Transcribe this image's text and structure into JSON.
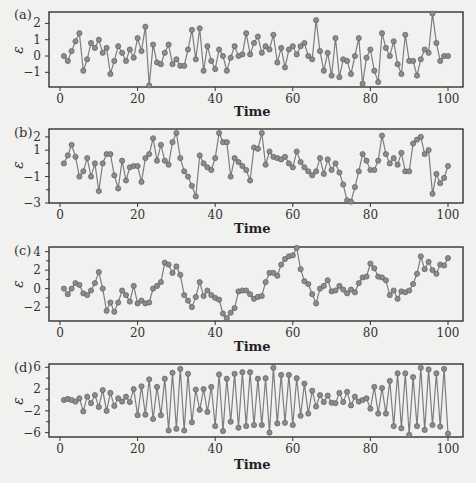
{
  "figure": {
    "background": "#f1f1ef",
    "line_color": "#7d7d7d",
    "marker_fill": "#8c8c8c",
    "marker_stroke": "#5e5e5e",
    "frame_color": "#333333"
  },
  "chart_data": [
    {
      "type": "line",
      "panel": "(a)",
      "title": "",
      "xlabel": "Time",
      "ylabel": "ε",
      "xlim": [
        -4,
        104
      ],
      "ylim": [
        -1.9,
        2.7
      ],
      "xticks": [
        0,
        20,
        40,
        60,
        80,
        100
      ],
      "yticks": [
        2,
        1,
        0,
        -1
      ],
      "grid": false,
      "x": [
        1,
        2,
        3,
        4,
        5,
        6,
        7,
        8,
        9,
        10,
        11,
        12,
        13,
        14,
        15,
        16,
        17,
        18,
        19,
        20,
        21,
        22,
        23,
        24,
        25,
        26,
        27,
        28,
        29,
        30,
        31,
        32,
        33,
        34,
        35,
        36,
        37,
        38,
        39,
        40,
        41,
        42,
        43,
        44,
        45,
        46,
        47,
        48,
        49,
        50,
        51,
        52,
        53,
        54,
        55,
        56,
        57,
        58,
        59,
        60,
        61,
        62,
        63,
        64,
        65,
        66,
        67,
        68,
        69,
        70,
        71,
        72,
        73,
        74,
        75,
        76,
        77,
        78,
        79,
        80,
        81,
        82,
        83,
        84,
        85,
        86,
        87,
        88,
        89,
        90,
        91,
        92,
        93,
        94,
        95,
        96,
        97,
        98,
        99,
        100
      ],
      "values": [
        0.0,
        -0.3,
        0.3,
        0.9,
        1.4,
        -0.9,
        -0.2,
        0.8,
        0.5,
        1.0,
        0.2,
        0.5,
        -1.1,
        -0.3,
        0.6,
        0.2,
        -0.3,
        0.4,
        -0.1,
        1.1,
        0.3,
        1.8,
        -1.8,
        0.7,
        -0.4,
        -0.5,
        0.2,
        0.7,
        -0.5,
        -0.2,
        -0.6,
        -0.6,
        0.4,
        1.6,
        -0.2,
        1.7,
        -0.9,
        0.6,
        -0.3,
        -0.8,
        0.4,
        0.0,
        -0.9,
        -0.1,
        0.6,
        0.0,
        0.1,
        1.4,
        0.1,
        0.8,
        1.2,
        0.2,
        0.6,
        0.4,
        1.3,
        -0.4,
        0.5,
        -0.7,
        0.4,
        0.6,
        0.1,
        0.6,
        0.8,
        0.0,
        -0.2,
        2.2,
        0.3,
        -0.9,
        0.2,
        -1.2,
        1.1,
        -1.3,
        -0.2,
        -0.3,
        -1.1,
        0.0,
        1.1,
        -1.7,
        -0.1,
        0.4,
        -0.9,
        -1.6,
        1.4,
        0.5,
        0.0,
        0.9,
        -0.5,
        -1.1,
        1.3,
        -0.3,
        -0.3,
        -1.2,
        -0.2,
        0.4,
        0.2,
        2.6,
        0.8,
        -0.3,
        0.0,
        0.0
      ],
      "series": [
        {
          "name": "(a)",
          "values_ref": "values"
        }
      ]
    },
    {
      "type": "line",
      "panel": "(b)",
      "title": "",
      "xlabel": "Time",
      "ylabel": "ε",
      "xlim": [
        -4,
        104
      ],
      "ylim": [
        -3.0,
        2.6
      ],
      "xticks": [
        0,
        20,
        40,
        60,
        80,
        100
      ],
      "yticks": [
        2,
        1,
        -1,
        -3
      ],
      "grid": false,
      "x": [
        1,
        2,
        3,
        4,
        5,
        6,
        7,
        8,
        9,
        10,
        11,
        12,
        13,
        14,
        15,
        16,
        17,
        18,
        19,
        20,
        21,
        22,
        23,
        24,
        25,
        26,
        27,
        28,
        29,
        30,
        31,
        32,
        33,
        34,
        35,
        36,
        37,
        38,
        39,
        40,
        41,
        42,
        43,
        44,
        45,
        46,
        47,
        48,
        49,
        50,
        51,
        52,
        53,
        54,
        55,
        56,
        57,
        58,
        59,
        60,
        61,
        62,
        63,
        64,
        65,
        66,
        67,
        68,
        69,
        70,
        71,
        72,
        73,
        74,
        75,
        76,
        77,
        78,
        79,
        80,
        81,
        82,
        83,
        84,
        85,
        86,
        87,
        88,
        89,
        90,
        91,
        92,
        93,
        94,
        95,
        96,
        97,
        98,
        99,
        100
      ],
      "values": [
        0.0,
        0.6,
        1.4,
        0.5,
        -1.0,
        -0.6,
        0.4,
        -1.0,
        0.0,
        -2.1,
        0.0,
        0.7,
        0.7,
        -0.9,
        -1.9,
        0.2,
        -1.3,
        -0.3,
        -0.2,
        -0.2,
        -1.4,
        0.4,
        0.7,
        1.9,
        0.2,
        1.4,
        0.2,
        -0.1,
        1.6,
        2.3,
        0.4,
        -0.6,
        -1.0,
        -1.7,
        -2.5,
        0.6,
        0.0,
        -0.3,
        -0.5,
        0.4,
        2.3,
        1.6,
        1.6,
        -1.0,
        0.4,
        0.1,
        -0.2,
        -0.5,
        -1.3,
        1.2,
        1.1,
        2.3,
        -0.1,
        0.9,
        0.5,
        0.4,
        0.3,
        0.5,
        0.0,
        -0.3,
        0.9,
        0.1,
        -0.3,
        -0.6,
        -0.9,
        -0.6,
        0.4,
        -0.8,
        0.3,
        -0.5,
        0.0,
        -0.7,
        -1.6,
        -2.8,
        -2.9,
        -1.8,
        -0.6,
        0.7,
        0.2,
        -0.5,
        -0.5,
        0.2,
        2.1,
        0.7,
        0.0,
        0.4,
        -0.1,
        0.8,
        -0.6,
        -0.6,
        1.5,
        1.8,
        2.0,
        0.7,
        1.0,
        -2.3,
        -0.8,
        -1.5,
        -1.1,
        -0.2,
        -0.5,
        0.0
      ],
      "series": [
        {
          "name": "(b)",
          "values_ref": "values"
        }
      ]
    },
    {
      "type": "line",
      "panel": "(c)",
      "title": "",
      "xlabel": "Time",
      "ylabel": "ε",
      "xlim": [
        -4,
        104
      ],
      "ylim": [
        -3.5,
        4.5
      ],
      "xticks": [
        0,
        20,
        40,
        60,
        80,
        100
      ],
      "yticks": [
        4,
        2,
        0,
        -2
      ],
      "grid": false,
      "x": [
        1,
        2,
        3,
        4,
        5,
        6,
        7,
        8,
        9,
        10,
        11,
        12,
        13,
        14,
        15,
        16,
        17,
        18,
        19,
        20,
        21,
        22,
        23,
        24,
        25,
        26,
        27,
        28,
        29,
        30,
        31,
        32,
        33,
        34,
        35,
        36,
        37,
        38,
        39,
        40,
        41,
        42,
        43,
        44,
        45,
        46,
        47,
        48,
        49,
        50,
        51,
        52,
        53,
        54,
        55,
        56,
        57,
        58,
        59,
        60,
        61,
        62,
        63,
        64,
        65,
        66,
        67,
        68,
        69,
        70,
        71,
        72,
        73,
        74,
        75,
        76,
        77,
        78,
        79,
        80,
        81,
        82,
        83,
        84,
        85,
        86,
        87,
        88,
        89,
        90,
        91,
        92,
        93,
        94,
        95,
        96,
        97,
        98,
        99,
        100
      ],
      "values": [
        0.0,
        -0.6,
        0.0,
        0.6,
        0.4,
        -0.5,
        -0.7,
        -0.2,
        0.6,
        1.8,
        0.0,
        -2.4,
        -1.5,
        -2.5,
        -1.5,
        -0.2,
        -0.7,
        -1.4,
        0.3,
        -1.6,
        -1.3,
        -1.6,
        -1.5,
        0.0,
        0.3,
        0.7,
        2.8,
        2.6,
        1.7,
        2.4,
        1.5,
        -0.7,
        -1.3,
        -2.0,
        -0.9,
        0.7,
        -0.8,
        -0.2,
        -0.7,
        -1.0,
        -1.2,
        -2.7,
        -3.2,
        -2.6,
        -2.1,
        -0.3,
        -0.2,
        -0.2,
        -0.6,
        -1.1,
        -0.9,
        -0.8,
        0.7,
        1.7,
        1.7,
        1.4,
        2.6,
        3.2,
        3.5,
        3.6,
        4.4,
        2.1,
        0.8,
        0.5,
        -0.6,
        -1.6,
        0.0,
        0.3,
        0.9,
        -0.3,
        -0.2,
        0.3,
        -0.1,
        -0.5,
        -0.1,
        -0.4,
        0.6,
        1.2,
        1.3,
        2.7,
        2.2,
        1.3,
        1.2,
        0.9,
        -0.7,
        -0.2,
        -1.1,
        -0.3,
        -0.4,
        -0.2,
        0.5,
        1.6,
        3.5,
        2.1,
        2.9,
        2.0,
        1.6,
        2.6,
        2.5,
        3.3
      ],
      "series": [
        {
          "name": "(c)",
          "values_ref": "values"
        }
      ]
    },
    {
      "type": "line",
      "panel": "(d)",
      "title": "",
      "xlabel": "Time",
      "ylabel": "ε",
      "xlim": [
        -4,
        104
      ],
      "ylim": [
        -6.8,
        6.6
      ],
      "xticks": [
        0,
        20,
        40,
        60,
        80,
        100
      ],
      "yticks": [
        6,
        2,
        -2,
        -6
      ],
      "grid": false,
      "x": [
        1,
        2,
        3,
        4,
        5,
        6,
        7,
        8,
        9,
        10,
        11,
        12,
        13,
        14,
        15,
        16,
        17,
        18,
        19,
        20,
        21,
        22,
        23,
        24,
        25,
        26,
        27,
        28,
        29,
        30,
        31,
        32,
        33,
        34,
        35,
        36,
        37,
        38,
        39,
        40,
        41,
        42,
        43,
        44,
        45,
        46,
        47,
        48,
        49,
        50,
        51,
        52,
        53,
        54,
        55,
        56,
        57,
        58,
        59,
        60,
        61,
        62,
        63,
        64,
        65,
        66,
        67,
        68,
        69,
        70,
        71,
        72,
        73,
        74,
        75,
        76,
        77,
        78,
        79,
        80,
        81,
        82,
        83,
        84,
        85,
        86,
        87,
        88,
        89,
        90,
        91,
        92,
        93,
        94,
        95,
        96,
        97,
        98,
        99,
        100
      ],
      "values": [
        0.0,
        0.2,
        0.0,
        -0.3,
        0.3,
        -2.1,
        0.6,
        -0.6,
        0.9,
        -1.3,
        1.8,
        -2.0,
        1.3,
        -1.1,
        0.3,
        -0.3,
        0.6,
        -0.4,
        2.0,
        -2.8,
        2.5,
        -2.7,
        3.8,
        -3.5,
        2.4,
        -2.8,
        3.9,
        -5.6,
        5.0,
        -5.3,
        5.7,
        -5.6,
        4.8,
        -4.1,
        1.9,
        -1.8,
        2.0,
        -2.2,
        2.4,
        -4.8,
        4.7,
        -5.7,
        3.9,
        -4.0,
        4.8,
        -5.1,
        5.1,
        -4.8,
        5.1,
        -4.6,
        3.9,
        -4.6,
        4.0,
        -6.0,
        5.9,
        -4.3,
        4.6,
        -4.2,
        4.6,
        -4.6,
        4.0,
        -2.9,
        3.0,
        -2.5,
        1.7,
        -1.2,
        0.9,
        -0.4,
        0.8,
        -0.5,
        -0.6,
        1.3,
        -0.4,
        1.5,
        -1.0,
        0.6,
        -0.3,
        0.0,
        0.3,
        -1.6,
        2.4,
        -2.5,
        2.2,
        -2.5,
        3.5,
        -4.8,
        4.9,
        -5.2,
        4.9,
        -6.4,
        4.2,
        -4.8,
        5.9,
        -5.5,
        5.6,
        -4.6,
        4.9,
        -4.9,
        5.7,
        -6.2
      ],
      "series": [
        {
          "name": "(d)",
          "values_ref": "values"
        }
      ]
    }
  ],
  "panels": [
    {
      "label": "(a)",
      "ylabel": "ε",
      "xlabel": "Time",
      "xtick_labels": [
        "0",
        "20",
        "40",
        "60",
        "80",
        "100"
      ],
      "ytick_labels": [
        "2",
        "1",
        "0",
        "−1"
      ]
    },
    {
      "label": "(b)",
      "ylabel": "ε",
      "xlabel": "Time",
      "xtick_labels": [
        "0",
        "20",
        "40",
        "60",
        "80",
        "100"
      ],
      "ytick_labels": [
        "2",
        "1",
        "−1",
        "−3"
      ]
    },
    {
      "label": "(c)",
      "ylabel": "ε",
      "xlabel": "Time",
      "xtick_labels": [
        "0",
        "20",
        "40",
        "60",
        "80",
        "100"
      ],
      "ytick_labels": [
        "4",
        "2",
        "0",
        "−2"
      ]
    },
    {
      "label": "(d)",
      "ylabel": "ε",
      "xlabel": "Time",
      "xtick_labels": [
        "0",
        "20",
        "40",
        "60",
        "80",
        "100"
      ],
      "ytick_labels": [
        "6",
        "2",
        "−2",
        "−6"
      ]
    }
  ]
}
